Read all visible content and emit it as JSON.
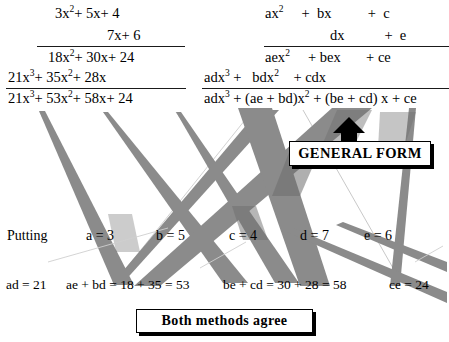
{
  "page": {
    "background": "#ffffff",
    "band_color": "#8b8b8b",
    "band_color_dark": "#6f6f6f",
    "ink_color": "#111111"
  },
  "numeric_example": {
    "label": "numeric-long-multiplication",
    "multiplicand": "3x² +  5x +  4",
    "multiplier": "7x +  6",
    "partial_product_1": "18x² + 30x + 24",
    "partial_product_2": "21x³ + 35x² + 28x",
    "total": "21x³ + 53x² + 58x + 24",
    "rows": [
      {
        "terms": [
          "3x",
          "2",
          "+  5x",
          "+  4"
        ]
      },
      {
        "terms": [
          "7x",
          "+  6"
        ]
      },
      {
        "terms": [
          "18x",
          "2",
          "+ 30x",
          "+ 24"
        ]
      },
      {
        "terms": [
          "21x",
          "3",
          "+ 35x",
          "2",
          "+ 28x"
        ]
      },
      {
        "terms": [
          "21x",
          "3",
          "+ 53x",
          "2",
          "+ 58x",
          "+ 24"
        ]
      }
    ]
  },
  "algebraic_example": {
    "label": "algebraic-general-form",
    "multiplicand": "ax² + bx + c",
    "multiplier": "dx + e",
    "partial_product_1": "aex² + bex + ce",
    "partial_product_2": "adx³ + bdx² + cdx",
    "total": "adx³ + (ae + bd)x² + (be + cd) x + ce"
  },
  "callouts": {
    "general_form": "GENERAL FORM",
    "both_methods": "Both methods agree"
  },
  "substitution": {
    "intro": "Putting",
    "assignments": [
      {
        "name": "a",
        "text": "a = 3",
        "value": 3
      },
      {
        "name": "b",
        "text": "b = 5",
        "value": 5
      },
      {
        "name": "c",
        "text": "c = 4",
        "value": 4
      },
      {
        "name": "d",
        "text": "d = 7",
        "value": 7
      },
      {
        "name": "e",
        "text": "e = 6",
        "value": 6
      }
    ]
  },
  "coefficients": {
    "items": [
      {
        "name": "ad",
        "text": "ad = 21"
      },
      {
        "name": "ae-bd",
        "text": "ae + bd = 18 + 35 = 53"
      },
      {
        "name": "be-cd",
        "text": "be + cd = 30 + 28 = 58"
      },
      {
        "name": "ce",
        "text": "ce = 24"
      }
    ]
  },
  "arrow": {
    "name": "up-arrow-to-general-form",
    "direction": "up"
  }
}
